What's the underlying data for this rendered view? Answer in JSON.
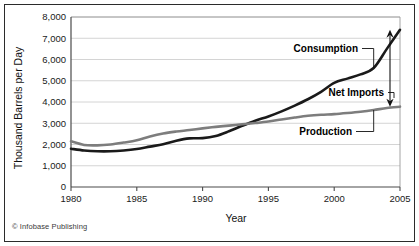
{
  "figure": {
    "credit": "© Infobase Publishing",
    "border_color": "#2b2b2b",
    "background": "#ffffff"
  },
  "chart_data": {
    "type": "line",
    "title": "",
    "xlabel": "Year",
    "ylabel": "Thousand Barrels per Day",
    "xlim": [
      1980,
      2005
    ],
    "ylim": [
      0,
      8000
    ],
    "grid": true,
    "grid_color": "#c9c9c9",
    "legend_position": "inline-annotations",
    "xticks": [
      1980,
      1985,
      1990,
      1995,
      2000,
      2005
    ],
    "xtick_labels": [
      "1980",
      "1985",
      "1990",
      "1995",
      "2000",
      "2005"
    ],
    "yticks": [
      0,
      1000,
      2000,
      3000,
      4000,
      5000,
      6000,
      7000,
      8000
    ],
    "ytick_labels": [
      "0",
      "1,000",
      "2,000",
      "3,000",
      "4,000",
      "5,000",
      "6,000",
      "7,000",
      "8,000"
    ],
    "x": [
      1980,
      1981,
      1982,
      1983,
      1984,
      1985,
      1986,
      1987,
      1988,
      1989,
      1990,
      1991,
      1992,
      1993,
      1994,
      1995,
      1996,
      1997,
      1998,
      1999,
      2000,
      2001,
      2002,
      2003,
      2004,
      2005
    ],
    "series": [
      {
        "name": "Consumption",
        "color": "#1a1a1a",
        "width": 2.6,
        "values": [
          1800,
          1720,
          1680,
          1680,
          1720,
          1790,
          1900,
          2010,
          2180,
          2290,
          2300,
          2400,
          2620,
          2880,
          3120,
          3320,
          3560,
          3830,
          4130,
          4480,
          4900,
          5100,
          5300,
          5600,
          6500,
          7400
        ]
      },
      {
        "name": "Production",
        "color": "#7d7d7d",
        "width": 2.6,
        "values": [
          2150,
          1980,
          1960,
          2000,
          2090,
          2200,
          2380,
          2520,
          2610,
          2680,
          2760,
          2830,
          2890,
          2950,
          3010,
          3080,
          3180,
          3270,
          3350,
          3400,
          3430,
          3480,
          3540,
          3620,
          3720,
          3780
        ]
      }
    ],
    "annotations": [
      {
        "label": "Consumption",
        "target_year": 2003,
        "target_value": 5600
      },
      {
        "label": "Net Imports",
        "target_year": 2005,
        "target_value": 5600,
        "arrow": "double-headed-vertical",
        "span_from": 3780,
        "span_to": 7400
      },
      {
        "label": "Production",
        "target_year": 2003,
        "target_value": 3620
      }
    ]
  }
}
